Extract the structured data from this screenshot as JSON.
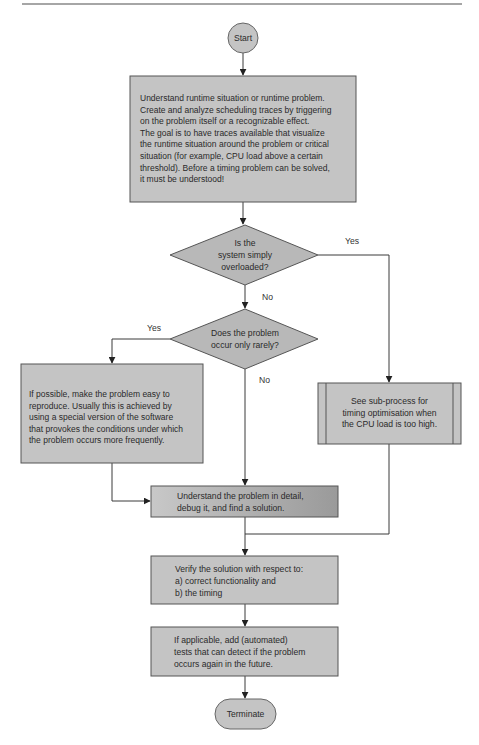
{
  "diagram": {
    "type": "flowchart",
    "nodes": {
      "start": {
        "shape": "circle",
        "label": "Start"
      },
      "understand_runtime": {
        "shape": "process",
        "label": "Understand runtime situation or runtime problem.\nCreate and analyze scheduling traces by triggering\non the problem itself or a recognizable effect.\nThe goal is to have traces available that visualize\nthe runtime situation around the problem or critical\nsituation (for example, CPU load above a certain\nthreshold). Before a timing problem can be solved,\nit must be understood!"
      },
      "decision_overloaded": {
        "shape": "decision",
        "label": "Is the\nsystem simply\noverloaded?"
      },
      "decision_rarely": {
        "shape": "decision",
        "label": "Does the problem\noccur only rarely?"
      },
      "reproduce": {
        "shape": "process",
        "label": "If possible, make the problem easy to\nreproduce. Usually this is achieved by\nusing a special version of the software\nthat provokes the conditions under which\nthe problem occurs more frequently."
      },
      "subprocess_timing": {
        "shape": "subprocess",
        "label": "See sub-process for\ntiming optimisation when\nthe CPU load is too high."
      },
      "debug": {
        "shape": "process",
        "label": "Understand the problem in detail,\ndebug it, and find a solution."
      },
      "verify": {
        "shape": "process",
        "label": "Verify the solution with respect to:\na) correct functionality and\nb) the timing"
      },
      "tests": {
        "shape": "process",
        "label": "If applicable, add (automated)\ntests that can detect if the problem\noccurs again in the future."
      },
      "terminate": {
        "shape": "terminator",
        "label": "Terminate"
      }
    },
    "edges": [
      {
        "from": "start",
        "to": "understand_runtime",
        "label": ""
      },
      {
        "from": "understand_runtime",
        "to": "decision_overloaded",
        "label": ""
      },
      {
        "from": "decision_overloaded",
        "to": "subprocess_timing",
        "label": "Yes"
      },
      {
        "from": "decision_overloaded",
        "to": "decision_rarely",
        "label": "No"
      },
      {
        "from": "decision_rarely",
        "to": "reproduce",
        "label": "Yes"
      },
      {
        "from": "decision_rarely",
        "to": "debug",
        "label": "No"
      },
      {
        "from": "reproduce",
        "to": "debug",
        "label": ""
      },
      {
        "from": "subprocess_timing",
        "to": "verify",
        "label": ""
      },
      {
        "from": "debug",
        "to": "verify",
        "label": ""
      },
      {
        "from": "verify",
        "to": "tests",
        "label": ""
      },
      {
        "from": "tests",
        "to": "terminate",
        "label": ""
      }
    ],
    "colors": {
      "node_fill": "#c4c4c4",
      "node_stroke": "#555555",
      "decision_fill": "#b8b8b8",
      "debug_fill_light": "#c8c8c8",
      "debug_fill_dark": "#9a9a9a",
      "line": "#3a3a3a",
      "rule": "#888888"
    }
  }
}
